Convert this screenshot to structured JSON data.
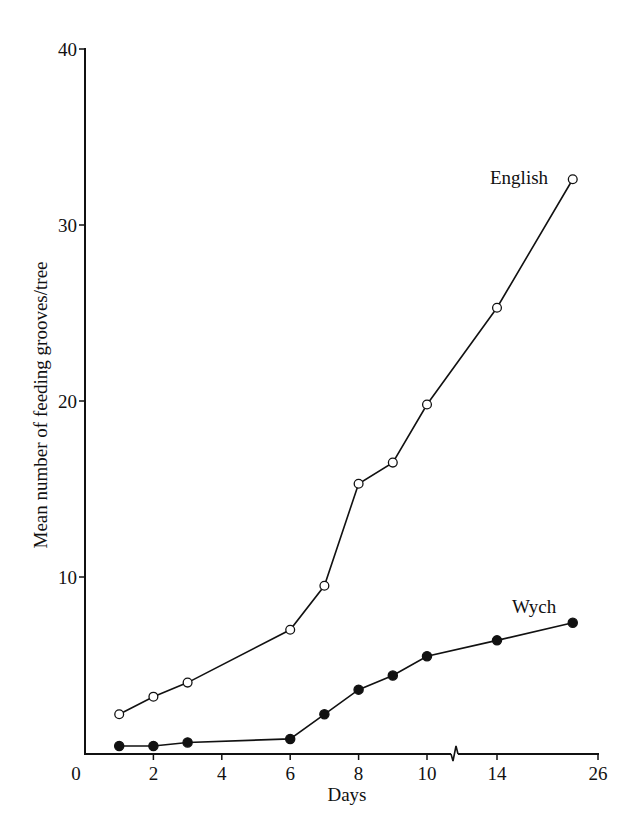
{
  "chart_data": {
    "type": "line",
    "title": "",
    "xlabel": "Days",
    "ylabel": "Mean number of feeding grooves/tree",
    "ylim": [
      0,
      40
    ],
    "y_ticks": [
      0,
      10,
      20,
      30,
      40
    ],
    "x_ticks": [
      0,
      2,
      4,
      6,
      8,
      10,
      14,
      26
    ],
    "x_axis_break": "between 10 and 14",
    "grid": false,
    "legend": "inline labels",
    "series": [
      {
        "name": "English",
        "marker": "open-circle",
        "x": [
          1,
          2,
          3,
          6,
          7,
          8,
          9,
          10,
          14,
          23
        ],
        "values": [
          2.2,
          3.2,
          4.0,
          7.0,
          9.5,
          15.3,
          16.5,
          19.8,
          25.3,
          32.6
        ]
      },
      {
        "name": "Wych",
        "marker": "filled-circle",
        "x": [
          1,
          2,
          3,
          6,
          7,
          8,
          9,
          10,
          14,
          23
        ],
        "values": [
          0.4,
          0.4,
          0.6,
          0.8,
          2.2,
          3.6,
          4.4,
          5.5,
          6.4,
          7.4
        ]
      }
    ]
  },
  "labels": {
    "xlabel": "Days",
    "ylabel": "Mean number of feeding grooves/tree",
    "x_tick_labels": [
      "0",
      "2",
      "4",
      "6",
      "8",
      "10",
      "14",
      "26"
    ],
    "y_tick_labels": [
      "10",
      "20",
      "30",
      "40"
    ],
    "series_english": "English",
    "series_wych": "Wych"
  }
}
